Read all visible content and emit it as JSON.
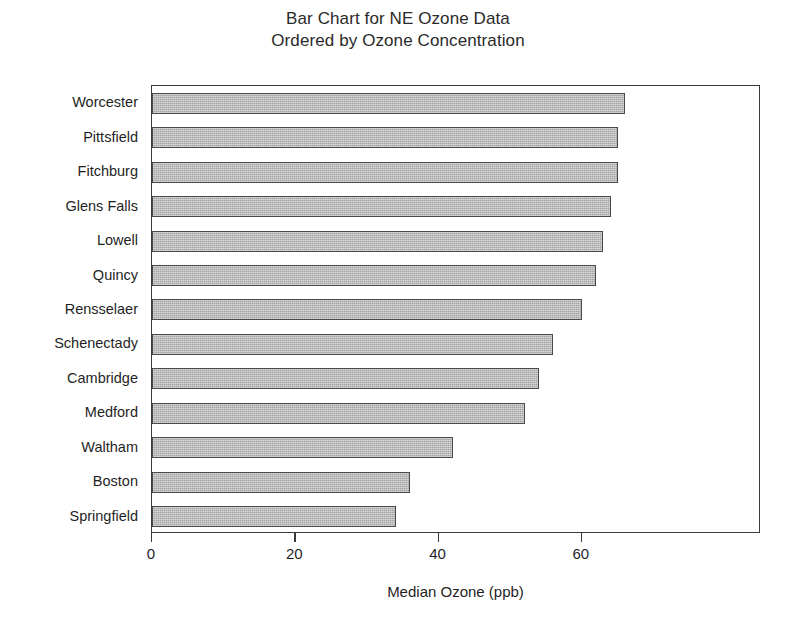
{
  "chart_data": {
    "type": "bar",
    "orientation": "horizontal",
    "title": "Bar Chart for NE Ozone Data",
    "subtitle": "Ordered by Ozone Concentration",
    "title_lines": [
      "Bar Chart for NE Ozone Data",
      "Ordered by Ozone Concentration"
    ],
    "xlabel": "Median Ozone (ppb)",
    "ylabel": "",
    "categories": [
      "Worcester",
      "Pittsfield",
      "Fitchburg",
      "Glens Falls",
      "Lowell",
      "Quincy",
      "Rensselaer",
      "Schenectady",
      "Cambridge",
      "Medford",
      "Waltham",
      "Boston",
      "Springfield"
    ],
    "values": [
      66,
      65,
      65,
      64,
      63,
      62,
      60,
      56,
      54,
      52,
      42,
      36,
      34
    ],
    "xlim": [
      0,
      85
    ],
    "xticks": [
      0,
      20,
      40,
      60
    ],
    "xtick_labels": [
      "0",
      "20",
      "40",
      "60"
    ],
    "grid": false,
    "legend": null,
    "bar_fill_color": "#b6b6b6",
    "bar_edge_color": "#4a4a4a",
    "frame_color": "#3a3a3a",
    "background_color": "#ffffff"
  }
}
